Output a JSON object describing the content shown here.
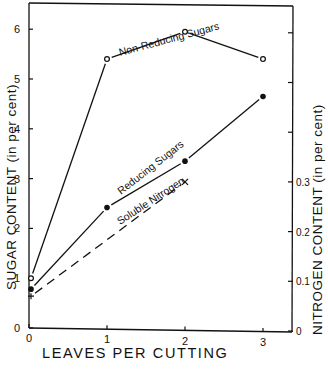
{
  "chart_data": {
    "type": "line",
    "title": "",
    "xlabel": "LEAVES PER CUTTING",
    "ylabel_left": "SUGAR CONTENT (in per cent)",
    "ylabel_right": "NITROGEN CONTENT (in per cent)",
    "x": [
      0,
      1,
      2,
      3
    ],
    "x_ticks": [
      "0",
      "1",
      "2",
      "3"
    ],
    "y_left_ticks": [
      "0",
      "1",
      "2",
      "3",
      "4",
      "5",
      "6"
    ],
    "y_left_range": [
      0,
      6.5
    ],
    "y_right_ticks": [
      "0",
      "0.1",
      "0.2",
      "0.3",
      "",
      "",
      ""
    ],
    "y_right_range": [
      0,
      0.65
    ],
    "grid": false,
    "legend": "inline labels along lines",
    "series": [
      {
        "name": "Non-Reducing Sugars",
        "axis": "left",
        "marker": "open-circle",
        "line": "solid",
        "x": [
          0,
          1,
          2,
          3
        ],
        "values": [
          1.0,
          5.4,
          5.95,
          5.4
        ]
      },
      {
        "name": "Reducing Sugars",
        "axis": "left",
        "marker": "filled-circle",
        "line": "solid",
        "x": [
          0,
          1,
          2,
          3
        ],
        "values": [
          0.78,
          2.42,
          3.35,
          4.65
        ]
      },
      {
        "name": "Soluble Nitrogen",
        "axis": "right",
        "marker": "x",
        "line": "dashed",
        "x": [
          0,
          2
        ],
        "values": [
          0.07,
          0.3
        ]
      }
    ]
  }
}
